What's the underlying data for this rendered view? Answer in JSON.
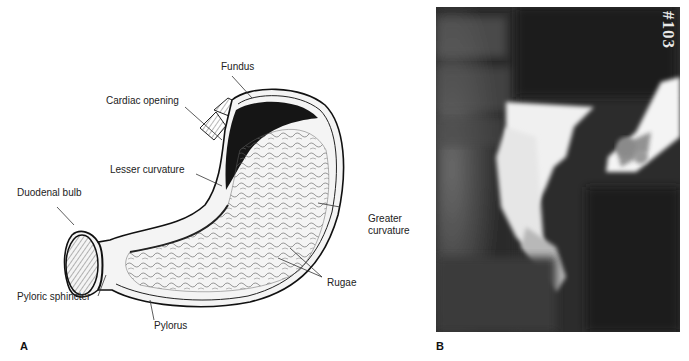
{
  "figure": {
    "panel_a": {
      "letter": "A",
      "description": "Line drawing of stomach cut open showing interior",
      "labels": {
        "fundus": "Fundus",
        "cardiac_opening": "Cardiac opening",
        "lesser_curvature": "Lesser curvature",
        "duodenal_bulb": "Duodenal bulb",
        "greater_curvature_line1": "Greater",
        "greater_curvature_line2": "curvature",
        "rugae": "Rugae",
        "pyloric_sphincter": "Pyloric sphincter",
        "pylorus": "Pylorus"
      }
    },
    "panel_b": {
      "letter": "B",
      "description": "Barium radiograph of stomach",
      "film_number": "#103"
    }
  },
  "colors": {
    "background": "#ffffff",
    "ink": "#1a1a1a",
    "xray_dark": "#2a2a2a",
    "xray_bright": "#f2f2f2"
  }
}
